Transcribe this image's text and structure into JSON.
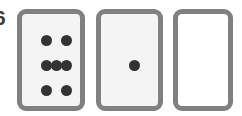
{
  "figure": {
    "kind": "domino-tile-row",
    "edge_label": "6",
    "background_color": "#ffffff",
    "tile_border_color": "#808080",
    "pip_color": "#333333",
    "tile_face_color": "#f4f4f4",
    "blank_tile_face_color": "#ffffff"
  },
  "tiles": [
    {
      "id": "tile-1",
      "name": "tile-seven-pips",
      "pip_count": 7,
      "pattern": "2-3-2",
      "face_color": "#f4f4f4",
      "pips": [
        {
          "x": 24,
          "y": 26
        },
        {
          "x": 44,
          "y": 26
        },
        {
          "x": 24,
          "y": 51
        },
        {
          "x": 34,
          "y": 51
        },
        {
          "x": 44,
          "y": 51
        },
        {
          "x": 24,
          "y": 76
        },
        {
          "x": 44,
          "y": 76
        }
      ]
    },
    {
      "id": "tile-2",
      "name": "tile-one-pip",
      "pip_count": 1,
      "pattern": "1",
      "face_color": "#f4f4f4",
      "pips": [
        {
          "x": 33,
          "y": 51
        }
      ]
    },
    {
      "id": "tile-3",
      "name": "tile-blank",
      "pip_count": 0,
      "pattern": "0",
      "face_color": "#ffffff",
      "pips": []
    }
  ]
}
